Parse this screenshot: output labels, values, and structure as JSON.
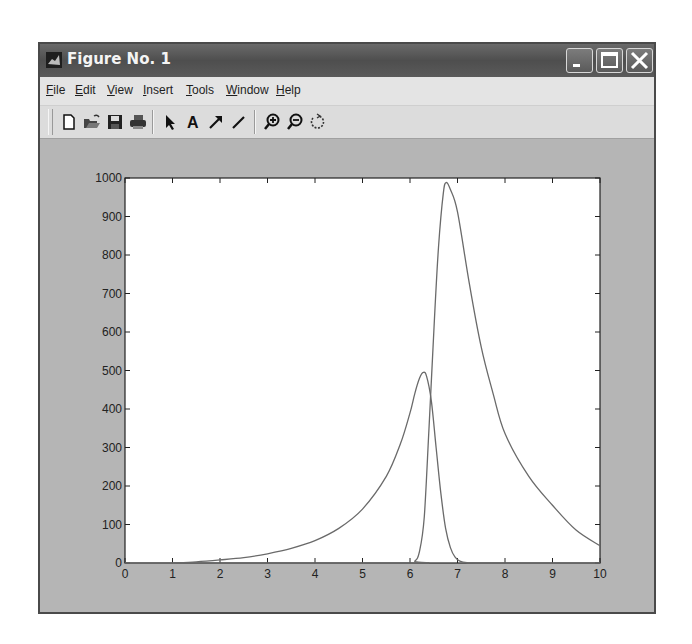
{
  "window": {
    "title": "Figure No. 1",
    "controls": [
      "minimize",
      "maximize",
      "close"
    ]
  },
  "menubar": {
    "items": [
      {
        "label": "File",
        "mnemonic": "F"
      },
      {
        "label": "Edit",
        "mnemonic": "E"
      },
      {
        "label": "View",
        "mnemonic": "V"
      },
      {
        "label": "Insert",
        "mnemonic": "I"
      },
      {
        "label": "Tools",
        "mnemonic": "T"
      },
      {
        "label": "Window",
        "mnemonic": "W"
      },
      {
        "label": "Help",
        "mnemonic": "H"
      }
    ]
  },
  "toolbar": {
    "tools": [
      "new-figure-icon",
      "open-file-icon",
      "save-icon",
      "print-icon",
      "select-arrow-icon",
      "insert-text-icon",
      "insert-arrow-icon",
      "insert-line-icon",
      "zoom-in-icon",
      "zoom-out-icon",
      "rotate-3d-icon"
    ]
  },
  "colors": {
    "figure_bg": "#b5b5b5",
    "axes_bg": "#ffffff",
    "line": "#6a6a6a",
    "titlebar": "#555555"
  },
  "chart_data": {
    "type": "line",
    "title": "",
    "xlabel": "",
    "ylabel": "",
    "xlim": [
      0,
      10
    ],
    "ylim": [
      0,
      1000
    ],
    "xticks": [
      0,
      1,
      2,
      3,
      4,
      5,
      6,
      7,
      8,
      9,
      10
    ],
    "yticks": [
      0,
      100,
      200,
      300,
      400,
      500,
      600,
      700,
      800,
      900,
      1000
    ],
    "grid": false,
    "legend": null,
    "series": [
      {
        "name": "curve 1 (broad peak)",
        "x": [
          1.0,
          1.5,
          2.0,
          2.5,
          3.0,
          3.5,
          4.0,
          4.5,
          5.0,
          5.5,
          5.8,
          6.0,
          6.1,
          6.2,
          6.28,
          6.35,
          6.45,
          6.55,
          6.65,
          6.75,
          6.85,
          6.95,
          7.05,
          7.2,
          7.5,
          10.0
        ],
        "y": [
          0,
          3,
          8,
          14,
          24,
          38,
          58,
          90,
          140,
          225,
          310,
          390,
          440,
          480,
          495,
          485,
          420,
          300,
          180,
          90,
          40,
          15,
          5,
          1,
          0,
          0
        ]
      },
      {
        "name": "curve 2 (tall peak)",
        "x": [
          0.0,
          5.9,
          6.1,
          6.2,
          6.3,
          6.4,
          6.5,
          6.6,
          6.7,
          6.76,
          6.85,
          7.0,
          7.25,
          7.5,
          7.75,
          8.0,
          8.5,
          9.0,
          9.5,
          10.0
        ],
        "y": [
          0,
          0,
          5,
          30,
          120,
          350,
          600,
          820,
          960,
          988,
          970,
          912,
          725,
          560,
          440,
          336,
          225,
          150,
          85,
          45
        ]
      }
    ]
  }
}
